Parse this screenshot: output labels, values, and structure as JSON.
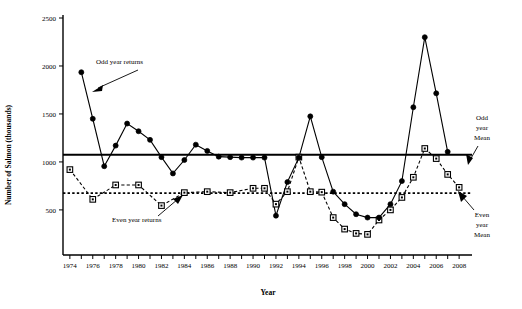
{
  "chart_data": {
    "type": "line",
    "title": "",
    "xlabel": "Year",
    "ylabel": "Number of Salmon (thousands)",
    "xlim": [
      1973.4,
      2008.6
    ],
    "ylim": [
      30,
      2500
    ],
    "grid": false,
    "legend_position": "none",
    "x_tick_labels": [
      "1974",
      "1976",
      "1978",
      "1980",
      "1982",
      "1984",
      "1986",
      "1988",
      "1990",
      "1992",
      "1994",
      "1996",
      "1998",
      "2000",
      "2002",
      "2004",
      "2006",
      "2008"
    ],
    "x_tick_values": [
      1974,
      1976,
      1978,
      1980,
      1982,
      1984,
      1986,
      1988,
      1990,
      1992,
      1994,
      1996,
      1998,
      2000,
      2002,
      2004,
      2006,
      2008
    ],
    "x_minor_ticks": [
      1975,
      1977,
      1979,
      1981,
      1983,
      1985,
      1987,
      1989,
      1991,
      1993,
      1995,
      1997,
      1999,
      2001,
      2003,
      2005,
      2007
    ],
    "y_tick_labels": [
      "500",
      "1000",
      "1500",
      "2000",
      "2500"
    ],
    "y_tick_values": [
      500,
      1000,
      1500,
      2000,
      2500
    ],
    "series": [
      {
        "name": "Odd year returns",
        "marker": "filled-circle",
        "linestyle": "solid",
        "x": [
          1975,
          1977,
          1979,
          1981,
          1983,
          1985,
          1987,
          1989,
          1991,
          1993,
          1995,
          1997,
          1999,
          2001,
          2003,
          2005,
          2007
        ],
        "values": [
          1935,
          1450,
          955,
          1170,
          1400,
          1320,
          1230,
          1050,
          880,
          1020,
          1180,
          1115,
          1055,
          1050,
          1045,
          1045,
          1470
        ],
        "points": [
          {
            "year": 1975,
            "value": 1935
          },
          {
            "year": 1976,
            "value": 1450
          },
          {
            "year": 1977,
            "value": 955
          },
          {
            "year": 1978,
            "value": 1170
          },
          {
            "year": 1979,
            "value": 1400
          },
          {
            "year": 1980,
            "value": 1320
          },
          {
            "year": 1981,
            "value": 1230
          },
          {
            "year": 1982,
            "value": 1050
          },
          {
            "year": 1983,
            "value": 880
          },
          {
            "year": 1984,
            "value": 1020
          },
          {
            "year": 1985,
            "value": 1180
          },
          {
            "year": 1986,
            "value": 1115
          },
          {
            "year": 1987,
            "value": 1055
          },
          {
            "year": 1988,
            "value": 1050
          },
          {
            "year": 1989,
            "value": 1045
          },
          {
            "year": 1990,
            "value": 1045
          },
          {
            "year": 1991,
            "value": 1045
          },
          {
            "year": 1992,
            "value": 440
          },
          {
            "year": 1993,
            "value": 790
          },
          {
            "year": 1994,
            "value": 1045
          },
          {
            "year": 1995,
            "value": 1475
          },
          {
            "year": 1996,
            "value": 1050
          },
          {
            "year": 1997,
            "value": 690
          },
          {
            "year": 1998,
            "value": 560
          },
          {
            "year": 1999,
            "value": 455
          },
          {
            "year": 2000,
            "value": 420
          },
          {
            "year": 2001,
            "value": 420
          },
          {
            "year": 2002,
            "value": 560
          },
          {
            "year": 2003,
            "value": 800
          },
          {
            "year": 2004,
            "value": 1570
          },
          {
            "year": 2005,
            "value": 2300
          },
          {
            "year": 2006,
            "value": 1715
          },
          {
            "year": 2007,
            "value": 1105
          }
        ]
      },
      {
        "name": "Even year returns",
        "marker": "open-square",
        "linestyle": "dashed",
        "points": [
          {
            "year": 1974,
            "value": 920
          },
          {
            "year": 1976,
            "value": 610
          },
          {
            "year": 1978,
            "value": 760
          },
          {
            "year": 1980,
            "value": 760
          },
          {
            "year": 1982,
            "value": 545
          },
          {
            "year": 1984,
            "value": 680
          },
          {
            "year": 1986,
            "value": 690
          },
          {
            "year": 1988,
            "value": 680
          },
          {
            "year": 1990,
            "value": 725
          },
          {
            "year": 1991,
            "value": 725
          },
          {
            "year": 1992,
            "value": 560
          },
          {
            "year": 1993,
            "value": 690
          },
          {
            "year": 1994,
            "value": 1050
          },
          {
            "year": 1995,
            "value": 690
          },
          {
            "year": 1996,
            "value": 685
          },
          {
            "year": 1997,
            "value": 420
          },
          {
            "year": 1998,
            "value": 300
          },
          {
            "year": 1999,
            "value": 255
          },
          {
            "year": 2000,
            "value": 245
          },
          {
            "year": 2001,
            "value": 395
          },
          {
            "year": 2002,
            "value": 500
          },
          {
            "year": 2003,
            "value": 630
          },
          {
            "year": 2004,
            "value": 840
          },
          {
            "year": 2005,
            "value": 1140
          },
          {
            "year": 2006,
            "value": 1035
          },
          {
            "year": 2007,
            "value": 870
          },
          {
            "year": 2008,
            "value": 735
          }
        ]
      }
    ],
    "reference_lines": [
      {
        "name": "Odd year Mean",
        "value": 1075,
        "style": "solid",
        "width": 2.2
      },
      {
        "name": "Even year Mean",
        "value": 675,
        "style": "dotted",
        "width": 1.6
      }
    ],
    "annotations": [
      {
        "id": "odd-year-returns",
        "text": "Odd year returns"
      },
      {
        "id": "even-year-returns",
        "text": "Even year returns"
      },
      {
        "id": "odd-year-mean",
        "line1": "Odd",
        "line2": "year",
        "line3": "Mean"
      },
      {
        "id": "even-year-mean",
        "line1": "Even",
        "line2": "year",
        "line3": "Mean"
      }
    ]
  }
}
